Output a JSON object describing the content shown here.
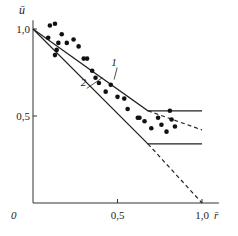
{
  "chart_data": {
    "type": "scatter",
    "title": "",
    "xlabel": "r̄",
    "ylabel": "ū",
    "xlim": [
      0,
      1.1
    ],
    "ylim": [
      0,
      1.05
    ],
    "grid": false,
    "x_ticks": [
      {
        "value": 0.5,
        "label": "0,5"
      },
      {
        "value": 1.0,
        "label": "1,0"
      }
    ],
    "y_ticks": [
      {
        "value": 0.5,
        "label": "0,5"
      },
      {
        "value": 1.0,
        "label": "1,0"
      }
    ],
    "origin_label": "0",
    "points": [
      {
        "x": 0.1,
        "y": 1.02
      },
      {
        "x": 0.13,
        "y": 1.03
      },
      {
        "x": 0.09,
        "y": 0.95
      },
      {
        "x": 0.15,
        "y": 0.92
      },
      {
        "x": 0.17,
        "y": 0.97
      },
      {
        "x": 0.2,
        "y": 0.92
      },
      {
        "x": 0.24,
        "y": 0.94
      },
      {
        "x": 0.27,
        "y": 0.9
      },
      {
        "x": 0.14,
        "y": 0.88
      },
      {
        "x": 0.13,
        "y": 0.85
      },
      {
        "x": 0.3,
        "y": 0.83
      },
      {
        "x": 0.32,
        "y": 0.83
      },
      {
        "x": 0.35,
        "y": 0.76
      },
      {
        "x": 0.37,
        "y": 0.72
      },
      {
        "x": 0.39,
        "y": 0.69
      },
      {
        "x": 0.43,
        "y": 0.64
      },
      {
        "x": 0.46,
        "y": 0.68
      },
      {
        "x": 0.5,
        "y": 0.61
      },
      {
        "x": 0.54,
        "y": 0.6
      },
      {
        "x": 0.56,
        "y": 0.54
      },
      {
        "x": 0.62,
        "y": 0.49
      },
      {
        "x": 0.63,
        "y": 0.49
      },
      {
        "x": 0.66,
        "y": 0.47
      },
      {
        "x": 0.7,
        "y": 0.43
      },
      {
        "x": 0.74,
        "y": 0.49
      },
      {
        "x": 0.76,
        "y": 0.45
      },
      {
        "x": 0.79,
        "y": 0.41
      },
      {
        "x": 0.81,
        "y": 0.53
      },
      {
        "x": 0.82,
        "y": 0.48
      },
      {
        "x": 0.84,
        "y": 0.44
      }
    ],
    "series": [
      {
        "name": "1",
        "segments": [
          {
            "style": "solid",
            "x": [
              0,
              0.68,
              1.0
            ],
            "y": [
              1.0,
              0.53,
              0.53
            ]
          },
          {
            "style": "dashed",
            "x": [
              0.68,
              1.0
            ],
            "y": [
              0.53,
              0.42
            ]
          }
        ]
      },
      {
        "name": "2",
        "segments": [
          {
            "style": "solid",
            "x": [
              0,
              0.68,
              1.0
            ],
            "y": [
              1.0,
              0.34,
              0.34
            ]
          },
          {
            "style": "dashed",
            "x": [
              0.68,
              1.0
            ],
            "y": [
              0.34,
              0.0
            ]
          }
        ]
      }
    ],
    "annotations": [
      {
        "text": "1",
        "x": 0.51,
        "y": 0.79,
        "points_to": {
          "x": 0.48,
          "y": 0.71
        }
      },
      {
        "text": "2",
        "x": 0.33,
        "y": 0.67,
        "points_to": {
          "x": 0.41,
          "y": 0.72
        }
      }
    ]
  }
}
